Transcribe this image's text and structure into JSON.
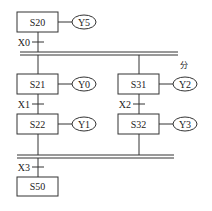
{
  "diagram": {
    "type": "sequential-function-chart",
    "steps": [
      {
        "id": "S20",
        "output": "Y5"
      },
      {
        "id": "S21",
        "output": "Y0"
      },
      {
        "id": "S22",
        "output": "Y1"
      },
      {
        "id": "S31",
        "output": "Y2"
      },
      {
        "id": "S32",
        "output": "Y3"
      },
      {
        "id": "S50",
        "output": ""
      }
    ],
    "transitions": [
      {
        "label": "X0"
      },
      {
        "label": "X1"
      },
      {
        "label": "X2"
      },
      {
        "label": "X3"
      }
    ],
    "branch_label": "分",
    "colors": {
      "line": "#333333",
      "background": "#ffffff"
    }
  }
}
